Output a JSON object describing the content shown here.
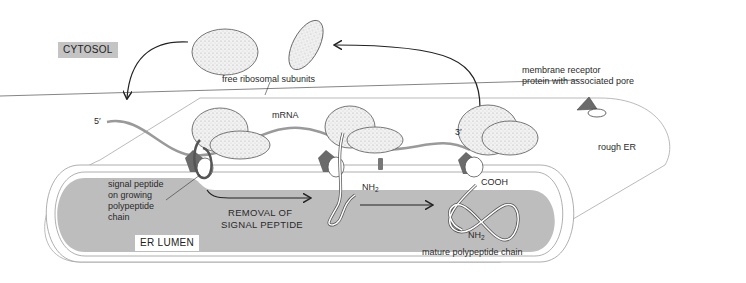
{
  "diagram": {
    "regions": {
      "cytosol_label": "CYTOSOL",
      "lumen_label": "ER LUMEN",
      "rough_er_label": "rough ER"
    },
    "labels": {
      "free_subunits": "free ribosomal subunits",
      "mrna": "mRNA",
      "five_prime": "5′",
      "three_prime": "3′",
      "receptor_line1": "membrane receptor",
      "receptor_line2": "protein with associated pore",
      "signal_line1": "signal peptide",
      "signal_line2": "on growing",
      "signal_line3": "polypeptide",
      "signal_line4": "chain",
      "removal_line1": "REMOVAL OF",
      "removal_line2": "SIGNAL PEPTIDE",
      "nh2_a": "NH",
      "nh2_b": "NH",
      "sub2": "2",
      "cooh": "COOH",
      "mature": "mature polypeptide chain"
    },
    "colors": {
      "lumen": "#bdbdbd",
      "cytosol_box": "#c4c4c4",
      "mrna": "#9a9a9a",
      "receptor": "#6b6b6b",
      "ribosome": "#ececec"
    }
  }
}
